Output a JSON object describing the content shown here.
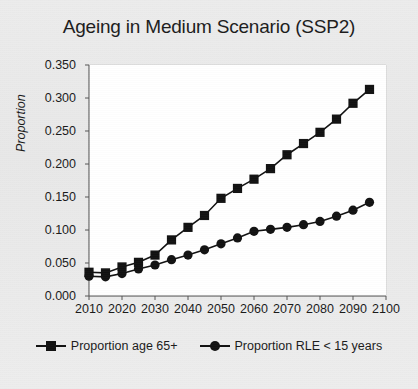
{
  "chart_data": {
    "type": "line",
    "title": "Ageing in Medium Scenario (SSP2)",
    "xlabel": "",
    "ylabel": "Proportion",
    "xlim": [
      2010,
      2100
    ],
    "ylim": [
      0.0,
      0.35
    ],
    "grid": true,
    "legend_position": "bottom",
    "xticks": [
      "2010",
      "2020",
      "2030",
      "2040",
      "2050",
      "2060",
      "2070",
      "2080",
      "2090",
      "2100"
    ],
    "yticks": [
      "0.000",
      "0.050",
      "0.100",
      "0.150",
      "0.200",
      "0.250",
      "0.300",
      "0.350"
    ],
    "x": [
      2010,
      2015,
      2020,
      2025,
      2030,
      2035,
      2040,
      2045,
      2050,
      2055,
      2060,
      2065,
      2070,
      2075,
      2080,
      2085,
      2090,
      2095
    ],
    "series": [
      {
        "name": "Proportion age 65+",
        "marker": "square",
        "color": "#111111",
        "values": [
          0.036,
          0.035,
          0.044,
          0.051,
          0.062,
          0.085,
          0.104,
          0.122,
          0.148,
          0.163,
          0.177,
          0.193,
          0.214,
          0.231,
          0.248,
          0.268,
          0.292,
          0.313
        ]
      },
      {
        "name": "Proportion RLE < 15 years",
        "marker": "circle",
        "color": "#111111",
        "values": [
          0.03,
          0.029,
          0.034,
          0.041,
          0.047,
          0.055,
          0.062,
          0.07,
          0.079,
          0.088,
          0.098,
          0.101,
          0.104,
          0.108,
          0.113,
          0.121,
          0.13,
          0.142
        ]
      }
    ]
  },
  "legend": {
    "items": [
      {
        "label": "Proportion age 65+",
        "marker": "square-marker-icon"
      },
      {
        "label": "Proportion RLE < 15 years",
        "marker": "circle-marker-icon"
      }
    ]
  }
}
